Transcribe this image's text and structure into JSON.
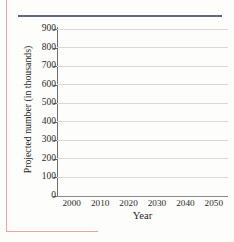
{
  "decor": {
    "page_border_color": "#e8a79c",
    "top_rule_color": "#5a6b80",
    "grid_color": "#d8d8d8",
    "axis_color": "#6d6d6d",
    "background": "#fdfdfc"
  },
  "chart_data": {
    "type": "line",
    "title": "",
    "subtitle": "",
    "xlabel": "Year",
    "ylabel": "Projected number (in thousands)",
    "x_tick_labels": [
      "2000",
      "2010",
      "2020",
      "2030",
      "2040",
      "2050"
    ],
    "x_ticks": [
      2000,
      2010,
      2020,
      2030,
      2040,
      2050
    ],
    "xlim": [
      1995,
      2055
    ],
    "y_tick_labels": [
      "0",
      "100",
      "200",
      "300",
      "400",
      "500",
      "600",
      "700",
      "800",
      "900"
    ],
    "y_ticks": [
      0,
      100,
      200,
      300,
      400,
      500,
      600,
      700,
      800,
      900
    ],
    "ylim": [
      0,
      900
    ],
    "grid": true,
    "grid_axis": "y",
    "legend": false,
    "legend_position": "none",
    "series": [],
    "values": [],
    "annotations": [],
    "note": "Empty plotting grid; no data series are drawn."
  }
}
